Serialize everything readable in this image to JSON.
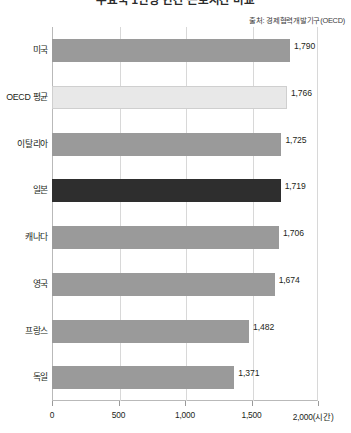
{
  "chart_data": {
    "type": "bar",
    "orientation": "horizontal",
    "title": "주요국 1인당 연간 근로시간 비교",
    "source_note": "출처: 경제협력개발기구(OECD)",
    "xlabel": "2,000(시간)",
    "ylabel": "",
    "xlim": [
      0,
      2000
    ],
    "xticks": [
      0,
      500,
      1000,
      1500,
      2000
    ],
    "xticklabels": [
      "0",
      "500",
      "1,000",
      "1,500",
      "2,000(시간)"
    ],
    "grid": true,
    "legend": "none",
    "categories": [
      "미국",
      "OECD 평균",
      "이탈리아",
      "일본",
      "캐나다",
      "영국",
      "프랑스",
      "독일"
    ],
    "values": [
      1790,
      1766,
      1725,
      1719,
      1706,
      1674,
      1482,
      1371
    ],
    "value_labels": [
      "1,790",
      "1,766",
      "1,725",
      "1,719",
      "1,706",
      "1,674",
      "1,482",
      "1,371"
    ],
    "bar_colors": [
      "#9a9a9a",
      "#e8e8e8",
      "#9a9a9a",
      "#2e2e2e",
      "#9a9a9a",
      "#9a9a9a",
      "#9a9a9a",
      "#9a9a9a"
    ],
    "highlight_category": "일본",
    "highlight_color": "#2e2e2e",
    "default_color": "#9a9a9a",
    "average_color": "#e8e8e8"
  },
  "axis": {
    "gridline_color": "#d8d8d8",
    "axis_color": "#b9b9b9"
  }
}
